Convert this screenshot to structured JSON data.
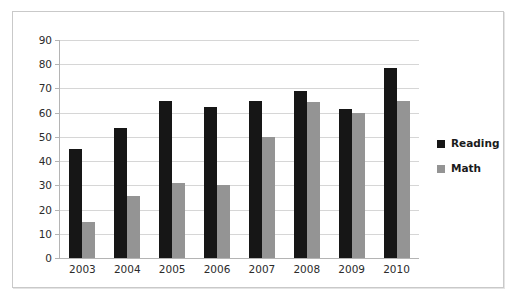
{
  "chart_data": {
    "type": "bar",
    "title": "",
    "subtitle": "",
    "xlabel": "",
    "ylabel": "",
    "categories": [
      "2003",
      "2004",
      "2005",
      "2006",
      "2007",
      "2008",
      "2009",
      "2010"
    ],
    "series": [
      {
        "name": "Reading",
        "color": "#161616",
        "values": [
          45,
          53.5,
          65,
          62.5,
          65,
          69,
          61.5,
          78.5
        ]
      },
      {
        "name": "Math",
        "color": "#949494",
        "values": [
          15,
          25.5,
          31,
          30,
          50,
          64.5,
          60,
          65
        ]
      }
    ],
    "ylim": [
      0,
      90
    ],
    "ytick_step": 10,
    "yticks": [
      "90",
      "80",
      "70",
      "60",
      "50",
      "40",
      "30",
      "20",
      "10",
      "0"
    ],
    "grid": true,
    "grid_axis": "y",
    "legend_position": "right"
  },
  "legend": {
    "entries": [
      {
        "label": "Reading",
        "swatch_color": "#161616"
      },
      {
        "label": "Math",
        "swatch_color": "#949494"
      }
    ]
  },
  "colors": {
    "reading": "#161616",
    "math": "#949494",
    "gridline": "#d6d6d6",
    "axis": "#b4b4b4",
    "frame_border": "#c9c9c9",
    "background": "#ffffff",
    "text": "#2b2b2b"
  }
}
